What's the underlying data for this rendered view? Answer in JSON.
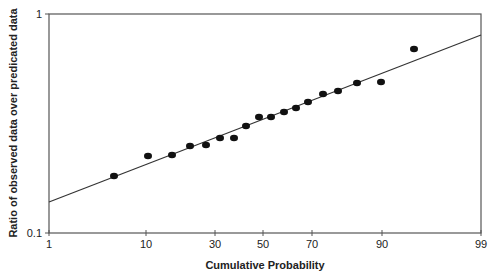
{
  "chart_data": {
    "type": "scatter",
    "title": "",
    "xlabel": "Cumulative Probability",
    "ylabel": "Ratio of observed data over predicated data",
    "x_scale": "probability",
    "y_scale": "log",
    "xlim": [
      1,
      99
    ],
    "ylim": [
      0.1,
      1
    ],
    "x_ticks": [
      1,
      10,
      30,
      50,
      70,
      90,
      99
    ],
    "x_tick_labels": [
      "1",
      "10",
      "30",
      "50",
      "70",
      "90",
      "99"
    ],
    "y_ticks": [
      0.1,
      1
    ],
    "y_tick_labels": [
      "0.1",
      "1"
    ],
    "grid": false,
    "legend": null,
    "series": [
      {
        "name": "Observed/Predicted ratio",
        "type": "scatter",
        "x": [
          5,
          11,
          17,
          22,
          28,
          33,
          39,
          44,
          50,
          56,
          61,
          67,
          72,
          74,
          79,
          84,
          90,
          95
        ],
        "y": [
          0.18,
          0.225,
          0.227,
          0.25,
          0.253,
          0.272,
          0.272,
          0.308,
          0.339,
          0.339,
          0.357,
          0.372,
          0.397,
          0.431,
          0.445,
          0.484,
          0.489,
          0.69
        ]
      },
      {
        "name": "Fitted line",
        "type": "line",
        "x": [
          1,
          99
        ],
        "y": [
          0.136,
          0.78
        ]
      }
    ]
  },
  "render": {
    "frame": {
      "left": 49,
      "right": 481,
      "top": 14,
      "bottom": 233
    },
    "x_tick_px": [
      49,
      146,
      215,
      263,
      312,
      382,
      481
    ],
    "y_tick_px": {
      "1": 14,
      "0.1": 233
    },
    "points_px": [
      [
        114,
        176
      ],
      [
        148,
        156
      ],
      [
        172,
        155
      ],
      [
        190,
        146
      ],
      [
        206,
        145
      ],
      [
        220,
        138
      ],
      [
        234,
        138
      ],
      [
        246,
        126
      ],
      [
        259,
        117
      ],
      [
        271,
        117
      ],
      [
        284,
        112
      ],
      [
        296,
        108
      ],
      [
        308,
        102
      ],
      [
        323,
        94
      ],
      [
        338,
        91
      ],
      [
        357,
        83
      ],
      [
        381,
        82
      ],
      [
        414,
        49
      ]
    ],
    "line_px": [
      [
        49,
        202
      ],
      [
        481,
        35
      ]
    ]
  }
}
